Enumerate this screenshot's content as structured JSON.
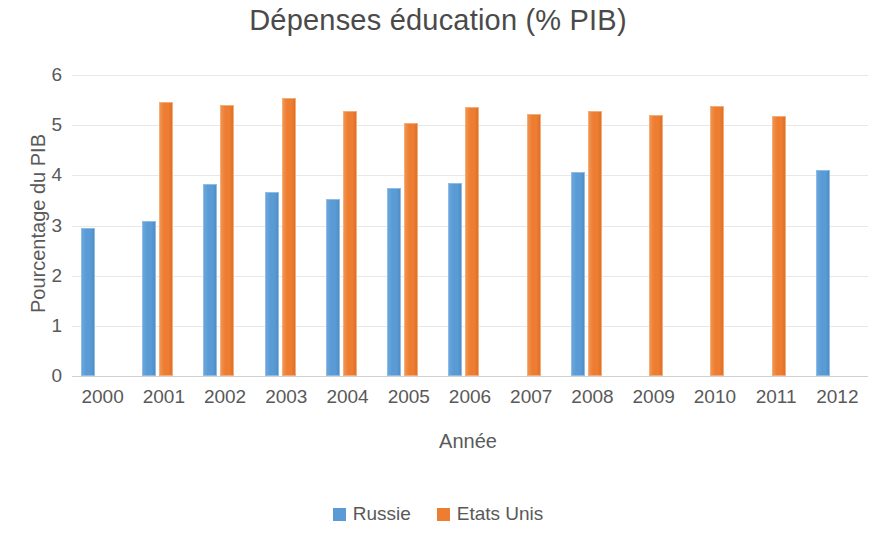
{
  "chart_data": {
    "type": "bar",
    "title": "Dépenses éducation (% PIB)",
    "xlabel": "Année",
    "ylabel": "Pourcentage du PIB",
    "categories": [
      "2000",
      "2001",
      "2002",
      "2003",
      "2004",
      "2005",
      "2006",
      "2007",
      "2008",
      "2009",
      "2010",
      "2011",
      "2012"
    ],
    "yticks": [
      0,
      1,
      2,
      3,
      4,
      5,
      6
    ],
    "ylim": [
      0,
      6
    ],
    "grid": true,
    "legend_position": "bottom",
    "series": [
      {
        "name": "Russie",
        "color": "#5B9BD5",
        "values": [
          2.95,
          3.09,
          3.83,
          3.66,
          3.52,
          3.74,
          3.85,
          null,
          4.06,
          null,
          null,
          null,
          4.11
        ]
      },
      {
        "name": "Etats Unis",
        "color": "#ED7D31",
        "values": [
          null,
          5.46,
          5.4,
          5.55,
          5.29,
          5.04,
          5.36,
          5.22,
          5.28,
          5.21,
          5.39,
          5.18,
          null
        ]
      }
    ]
  }
}
